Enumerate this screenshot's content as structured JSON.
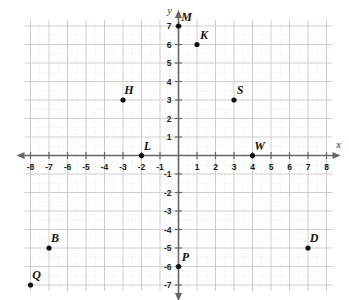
{
  "figure": {
    "title": "",
    "x_axis_label": "x",
    "y_axis_label": "y"
  },
  "chart_data": {
    "type": "scatter",
    "title": "",
    "xlabel": "x",
    "ylabel": "y",
    "xlim": [
      -8,
      8
    ],
    "ylim": [
      -7,
      7
    ],
    "x_ticks": [
      -8,
      -7,
      -6,
      -5,
      -4,
      -3,
      -2,
      -1,
      1,
      2,
      3,
      4,
      5,
      6,
      7,
      8
    ],
    "y_ticks": [
      7,
      6,
      5,
      4,
      3,
      2,
      1,
      -1,
      -2,
      -3,
      -4,
      -5,
      -6,
      -7
    ],
    "x_tick_labels": [
      "-8",
      "-7",
      "-6",
      "-5",
      "-4",
      "-3",
      "-2",
      "-1",
      "1",
      "2",
      "3",
      "4",
      "5",
      "6",
      "7",
      "8"
    ],
    "y_tick_labels": [
      "7",
      "6",
      "5",
      "4",
      "3",
      "2",
      "1",
      "-1",
      "-2",
      "-3",
      "-4",
      "-5",
      "-6",
      "-7"
    ],
    "grid": true,
    "minor_grid": true,
    "legend": "none",
    "point_color": "#111111",
    "grid_color": "#c9c9c9",
    "minor_grid_color": "#e2e2e2",
    "axis_color": "#666666",
    "points": [
      {
        "label": "M",
        "x": 0,
        "y": 7,
        "label_dx": 8,
        "label_dy": -5
      },
      {
        "label": "K",
        "x": 1,
        "y": 6,
        "label_dx": 7,
        "label_dy": -6
      },
      {
        "label": "H",
        "x": -3,
        "y": 3,
        "label_dx": 6,
        "label_dy": -6
      },
      {
        "label": "S",
        "x": 3,
        "y": 3,
        "label_dx": 6,
        "label_dy": -6
      },
      {
        "label": "L",
        "x": -2,
        "y": 0,
        "label_dx": 6,
        "label_dy": -6
      },
      {
        "label": "W",
        "x": 4,
        "y": 0,
        "label_dx": 7,
        "label_dy": -6
      },
      {
        "label": "B",
        "x": -7,
        "y": -5,
        "label_dx": 6,
        "label_dy": -6
      },
      {
        "label": "D",
        "x": 7,
        "y": -5,
        "label_dx": 6,
        "label_dy": -6
      },
      {
        "label": "P",
        "x": 0,
        "y": -6,
        "label_dx": 7,
        "label_dy": -6
      },
      {
        "label": "Q",
        "x": -8,
        "y": -7,
        "label_dx": 6,
        "label_dy": -6
      }
    ]
  }
}
